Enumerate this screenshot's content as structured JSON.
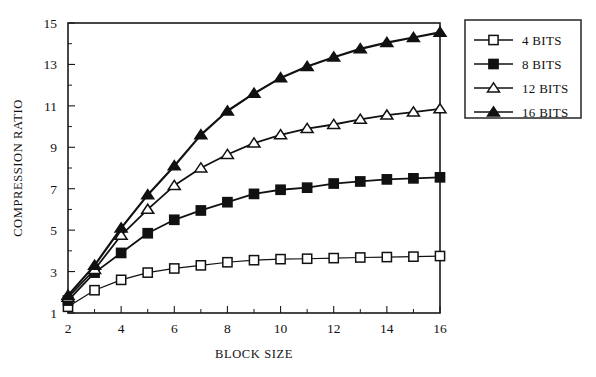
{
  "chart_data": {
    "type": "line",
    "title": "",
    "xlabel": "BLOCK SIZE",
    "ylabel": "COMPRESSION RATIO",
    "xlim": [
      2,
      16
    ],
    "ylim": [
      1,
      15
    ],
    "xticks": [
      2,
      4,
      6,
      8,
      10,
      12,
      14,
      16
    ],
    "yticks": [
      1,
      3,
      5,
      7,
      9,
      11,
      13,
      15
    ],
    "xtick_labels": [
      "2",
      "4",
      "6",
      "8",
      "10",
      "12",
      "14",
      "16"
    ],
    "ytick_labels": [
      "1",
      "3",
      "5",
      "7",
      "9",
      "11",
      "13",
      "15"
    ],
    "minor_xticks": [
      3,
      5,
      7,
      9,
      11,
      13,
      15
    ],
    "minor_yticks": [
      2,
      4,
      6,
      8,
      10,
      12,
      14
    ],
    "grid": false,
    "legend_position": "right-outside",
    "x": [
      2,
      3,
      4,
      5,
      6,
      7,
      8,
      9,
      10,
      11,
      12,
      13,
      14,
      15,
      16
    ],
    "series": [
      {
        "name": "4 BITS",
        "marker": "open-square",
        "marker_fill": "#ffffff",
        "marker_stroke": "#111111",
        "line_width": 1.2,
        "values": [
          1.3,
          2.1,
          2.6,
          2.95,
          3.15,
          3.3,
          3.45,
          3.55,
          3.6,
          3.62,
          3.65,
          3.68,
          3.7,
          3.72,
          3.75
        ]
      },
      {
        "name": "8 BITS",
        "marker": "filled-square",
        "marker_fill": "#111111",
        "marker_stroke": "#111111",
        "line_width": 1.8,
        "values": [
          1.6,
          2.95,
          3.9,
          4.85,
          5.5,
          5.95,
          6.35,
          6.75,
          6.95,
          7.05,
          7.25,
          7.35,
          7.45,
          7.5,
          7.55
        ]
      },
      {
        "name": "12 BITS",
        "marker": "open-triangle",
        "marker_fill": "#ffffff",
        "marker_stroke": "#111111",
        "line_width": 1.8,
        "values": [
          1.75,
          3.1,
          4.75,
          6.0,
          7.15,
          8.0,
          8.65,
          9.2,
          9.6,
          9.9,
          10.1,
          10.35,
          10.55,
          10.7,
          10.85
        ]
      },
      {
        "name": "16 BITS",
        "marker": "filled-triangle",
        "marker_fill": "#111111",
        "marker_stroke": "#111111",
        "line_width": 2.2,
        "values": [
          1.85,
          3.3,
          5.1,
          6.7,
          8.1,
          9.6,
          10.75,
          11.6,
          12.35,
          12.9,
          13.35,
          13.75,
          14.05,
          14.3,
          14.55
        ]
      }
    ]
  },
  "legend": {
    "entries": [
      {
        "label": "4 BITS"
      },
      {
        "label": "8 BITS"
      },
      {
        "label": "12 BITS"
      },
      {
        "label": "16 BITS"
      }
    ]
  },
  "colors": {
    "foreground": "#111111",
    "background": "#ffffff",
    "frame": "#1a1a1a"
  }
}
